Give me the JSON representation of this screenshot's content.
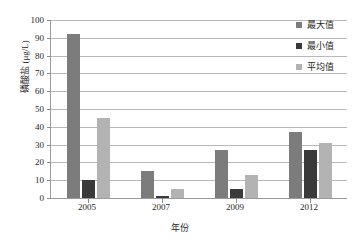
{
  "chart_data": {
    "type": "bar",
    "title": "",
    "xlabel": "年份",
    "ylabel": "磷酸盐 (μg/L)",
    "categories": [
      "2005",
      "2007",
      "2009",
      "2012"
    ],
    "series": [
      {
        "name": "最大值",
        "values": [
          92,
          15,
          27,
          37
        ],
        "color": "#7c7c7c"
      },
      {
        "name": "最小值",
        "values": [
          10,
          1,
          5,
          27
        ],
        "color": "#3a3a3a"
      },
      {
        "name": "平均值",
        "values": [
          45,
          5,
          13,
          31
        ],
        "color": "#b3b3b3"
      }
    ],
    "ylim": [
      0,
      100
    ],
    "ytick_step": 10,
    "yticks": [
      0,
      10,
      20,
      30,
      40,
      50,
      60,
      70,
      80,
      90,
      100
    ],
    "grid": true,
    "legend_position": "right"
  },
  "legend": {
    "items": [
      {
        "label": "最大值",
        "color": "#7c7c7c"
      },
      {
        "label": "最小值",
        "color": "#3a3a3a"
      },
      {
        "label": "平均值",
        "color": "#b3b3b3"
      }
    ]
  }
}
